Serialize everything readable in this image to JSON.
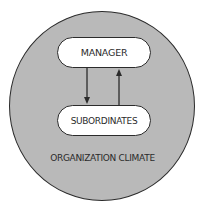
{
  "diagram": {
    "container": {
      "label": "ORGANIZATION CLIMATE",
      "fill": "#b9b9b9",
      "stroke": "#2b2b2b"
    },
    "nodes": [
      {
        "id": "manager",
        "label": "MANAGER"
      },
      {
        "id": "subordinates",
        "label": "SUBORDINATES"
      }
    ],
    "edges": [
      {
        "from": "manager",
        "to": "subordinates",
        "direction": "down"
      },
      {
        "from": "subordinates",
        "to": "manager",
        "direction": "up"
      }
    ],
    "colors": {
      "node_fill": "#ffffff",
      "text": "#2b2b2b",
      "background": "#ffffff"
    }
  }
}
